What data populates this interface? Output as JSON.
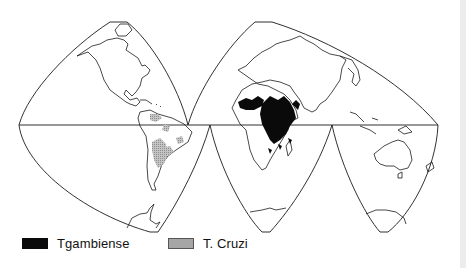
{
  "figure": {
    "type": "interrupted world map (Goode homolosine style)",
    "projection_lobes": [
      "Americas",
      "Europe-Africa",
      "Asia-Australia"
    ],
    "colors": {
      "outline": "#1a1a1a",
      "tgambiense_fill": "#0a0a0a",
      "tcruzi_fill": "#bdbdbd",
      "background": "#ffffff"
    }
  },
  "legend": {
    "items": [
      {
        "label": "Tgambiense",
        "swatch": "solid-black"
      },
      {
        "label": "T. Cruzi",
        "swatch": "stippled-gray"
      }
    ]
  },
  "regions": {
    "tgambiense": "West and Central Africa (sub-Saharan belt)",
    "tcruzi": "Central and South America"
  }
}
